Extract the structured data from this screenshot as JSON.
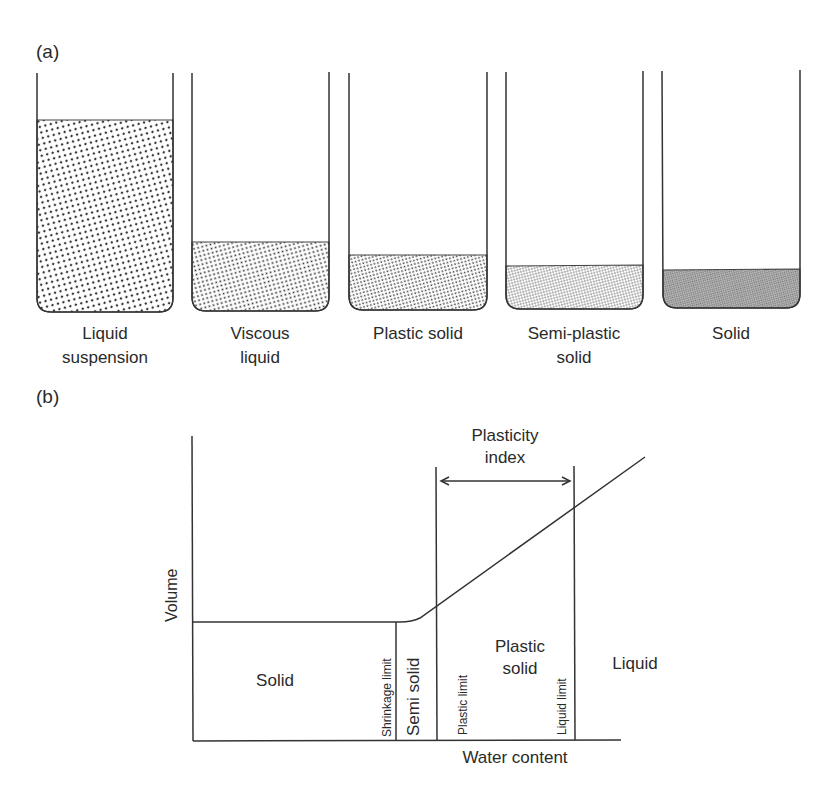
{
  "panel_a": {
    "label": "(a)",
    "beakers": [
      {
        "label_line1": "Liquid",
        "label_line2": "suspension",
        "fill_level": "high",
        "texture": "coarse-dots"
      },
      {
        "label_line1": "Viscous",
        "label_line2": "liquid",
        "fill_level": "low",
        "texture": "medium-dots"
      },
      {
        "label_line1": "Plastic solid",
        "label_line2": "",
        "fill_level": "lower",
        "texture": "fine-dots"
      },
      {
        "label_line1": "Semi-plastic",
        "label_line2": "solid",
        "fill_level": "lower",
        "texture": "finer-dots"
      },
      {
        "label_line1": "Solid",
        "label_line2": "",
        "fill_level": "lowest",
        "texture": "dense-dots"
      }
    ]
  },
  "panel_b": {
    "label": "(b)",
    "y_axis_label": "Volume",
    "x_axis_label": "Water content",
    "regions": {
      "solid": "Solid",
      "semi_solid": "Semi solid",
      "plastic_line1": "Plastic",
      "plastic_line2": "solid",
      "liquid": "Liquid"
    },
    "limits": {
      "shrinkage": "Shrinkage limit",
      "plastic": "Plastic limit",
      "liquid": "Liquid limit"
    },
    "plasticity_index_line1": "Plasticity",
    "plasticity_index_line2": "index"
  }
}
